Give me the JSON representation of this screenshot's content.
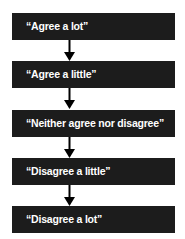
{
  "diagram": {
    "type": "flowchart-vertical",
    "nodes": [
      {
        "label": "“Agree a lot”"
      },
      {
        "label": "“Agree a little”"
      },
      {
        "label": "“Neither agree nor disagree”"
      },
      {
        "label": "“Disagree a little”"
      },
      {
        "label": "“Disagree a lot”"
      }
    ],
    "edges": [
      {
        "from": 0,
        "to": 1,
        "icon": "arrow-down-icon"
      },
      {
        "from": 1,
        "to": 2,
        "icon": "arrow-down-icon"
      },
      {
        "from": 2,
        "to": 3,
        "icon": "arrow-down-icon"
      },
      {
        "from": 3,
        "to": 4,
        "icon": "arrow-down-icon"
      }
    ],
    "colors": {
      "box_fill": "#1c1c1c",
      "box_text": "#ffffff",
      "arrow": "#000000",
      "background": "#ffffff"
    }
  }
}
